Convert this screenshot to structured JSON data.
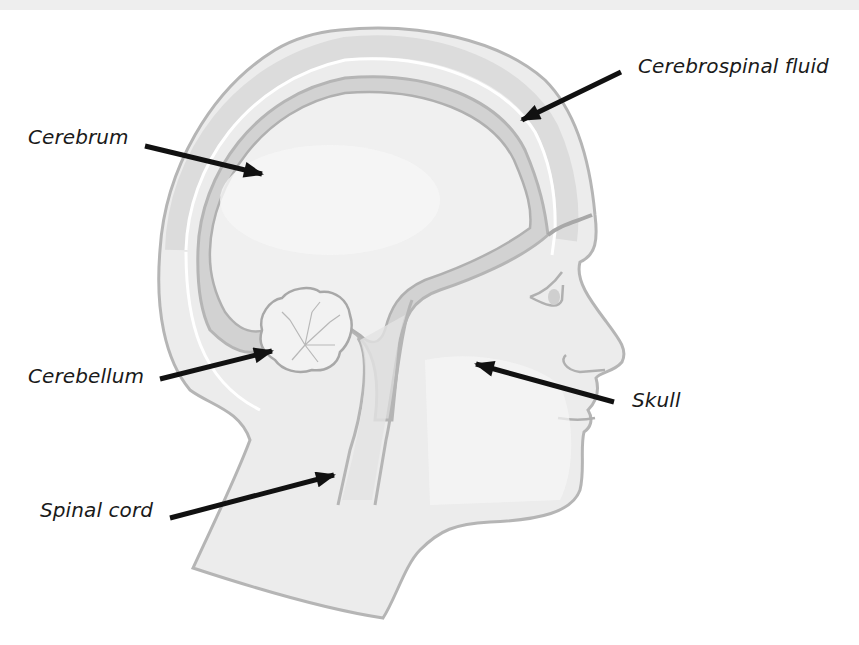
{
  "diagram": {
    "colors": {
      "background": "#ffffff",
      "top_strip": "#eeeeee",
      "skin_fill": "#ececec",
      "outline": "#b5b5b5",
      "brain_fill": "#efefef",
      "csf_band": "#d2d2d2",
      "arrow": "#111111",
      "label_text": "#1a1a1a"
    },
    "labels": [
      {
        "id": "cerebrum",
        "text": "Cerebrum"
      },
      {
        "id": "cerebrospinal-fluid",
        "text": "Cerebrospinal fluid"
      },
      {
        "id": "cerebellum",
        "text": "Cerebellum"
      },
      {
        "id": "skull",
        "text": "Skull"
      },
      {
        "id": "spinal-cord",
        "text": "Spinal cord"
      }
    ]
  }
}
